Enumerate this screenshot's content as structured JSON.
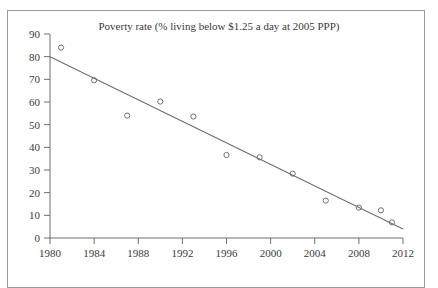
{
  "chart_data": {
    "type": "scatter",
    "title": "Poverty rate (% living below $1.25 a day at 2005 PPP)",
    "xlabel": "",
    "ylabel": "",
    "xlim": [
      1980,
      2012
    ],
    "ylim": [
      0,
      90
    ],
    "xticks": [
      1980,
      1984,
      1988,
      1992,
      1996,
      2000,
      2004,
      2008,
      2012
    ],
    "yticks": [
      0,
      10,
      20,
      30,
      40,
      50,
      60,
      70,
      80,
      90
    ],
    "xtick_labels": [
      "1980",
      "1984",
      "1988",
      "1992",
      "1996",
      "2000",
      "2004",
      "2008",
      "2012"
    ],
    "ytick_labels": [
      "0",
      "10",
      "20",
      "30",
      "40",
      "50",
      "60",
      "70",
      "80",
      "90"
    ],
    "grid": false,
    "legend": null,
    "marker": "open-circle",
    "marker_color": "#6e6e6e",
    "line_color": "#6e6e6e",
    "points": [
      {
        "x": 1981,
        "y": 84.0
      },
      {
        "x": 1984,
        "y": 69.6
      },
      {
        "x": 1987,
        "y": 54.0
      },
      {
        "x": 1990,
        "y": 60.2
      },
      {
        "x": 1993,
        "y": 53.6
      },
      {
        "x": 1996,
        "y": 36.6
      },
      {
        "x": 1999,
        "y": 35.6
      },
      {
        "x": 2002,
        "y": 28.4
      },
      {
        "x": 2005,
        "y": 16.5
      },
      {
        "x": 2008,
        "y": 13.4
      },
      {
        "x": 2010,
        "y": 12.2
      },
      {
        "x": 2011,
        "y": 6.9
      }
    ],
    "trendline": {
      "type": "line",
      "x0": 1980,
      "y0": 80.0,
      "x1": 2012,
      "y1": 4.0
    }
  },
  "figure": {
    "background_color": "#ffffff",
    "border_color": "#9a9a9a",
    "axis_color": "#6e6e6e",
    "text_color": "#3a3a3a"
  }
}
